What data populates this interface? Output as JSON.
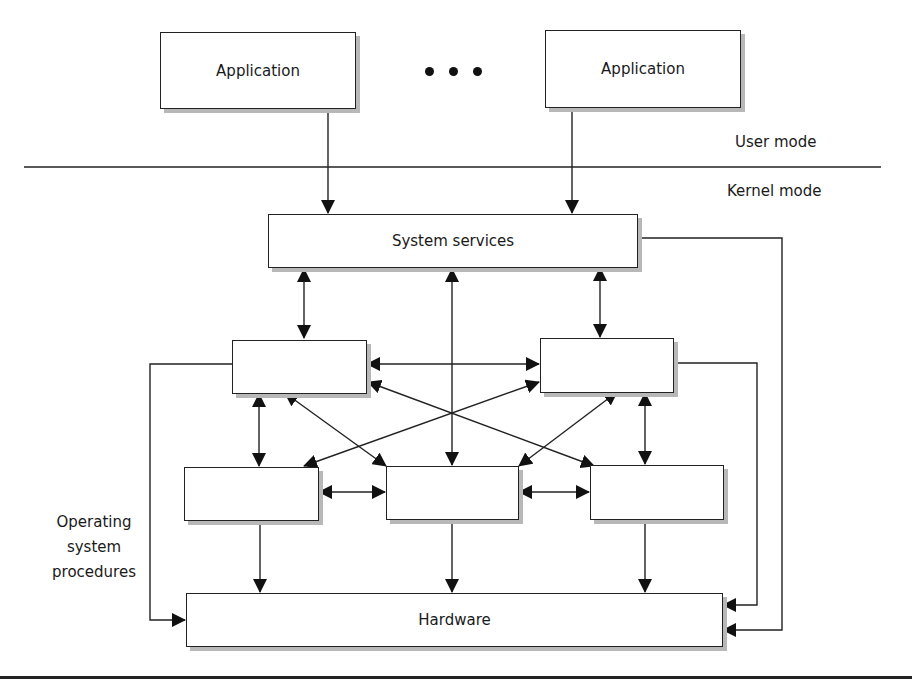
{
  "diagram": {
    "applications": [
      {
        "label": "Application"
      },
      {
        "label": "Application"
      }
    ],
    "ellipsis": "• • •",
    "mode_labels": {
      "user": "User mode",
      "kernel": "Kernel mode"
    },
    "system_services": {
      "label": "System services"
    },
    "procedures_label": "Operating\nsystem\nprocedures",
    "procedures_label_lines": [
      "Operating",
      "system",
      "procedures"
    ],
    "procedure_boxes": [
      {
        "id": "upper-left",
        "label": ""
      },
      {
        "id": "upper-right",
        "label": ""
      },
      {
        "id": "lower-left",
        "label": ""
      },
      {
        "id": "lower-middle",
        "label": ""
      },
      {
        "id": "lower-right",
        "label": ""
      }
    ],
    "hardware": {
      "label": "Hardware"
    },
    "colors": {
      "line": "#222222",
      "box_fill": "#ffffff",
      "shadow": "#b8b8b8"
    }
  }
}
